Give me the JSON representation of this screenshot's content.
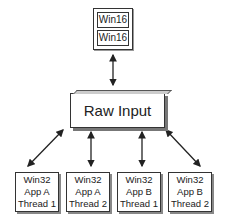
{
  "diagram": {
    "top_group": {
      "boxes": [
        {
          "label": "Win16"
        },
        {
          "label": "Win16"
        }
      ]
    },
    "center": {
      "label": "Raw Input"
    },
    "bottom_boxes": [
      {
        "line1": "Win32",
        "line2": "App A",
        "line3": "Thread 1"
      },
      {
        "line1": "Win32",
        "line2": "App A",
        "line3": "Thread 2"
      },
      {
        "line1": "Win32",
        "line2": "App B",
        "line3": "Thread 1"
      },
      {
        "line1": "Win32",
        "line2": "App B",
        "line3": "Thread 2"
      }
    ],
    "connectors": [
      {
        "from": "Win16 group",
        "to": "Raw Input",
        "type": "bidirectional"
      },
      {
        "from": "Raw Input",
        "to": "Win32 App A Thread 1",
        "type": "bidirectional"
      },
      {
        "from": "Raw Input",
        "to": "Win32 App A Thread 2",
        "type": "bidirectional"
      },
      {
        "from": "Raw Input",
        "to": "Win32 App B Thread 1",
        "type": "bidirectional"
      },
      {
        "from": "Raw Input",
        "to": "Win32 App B Thread 2",
        "type": "bidirectional"
      }
    ],
    "colors": {
      "line": "#222222",
      "border": "#333333",
      "shadow": "#777777",
      "background": "#ffffff"
    }
  }
}
